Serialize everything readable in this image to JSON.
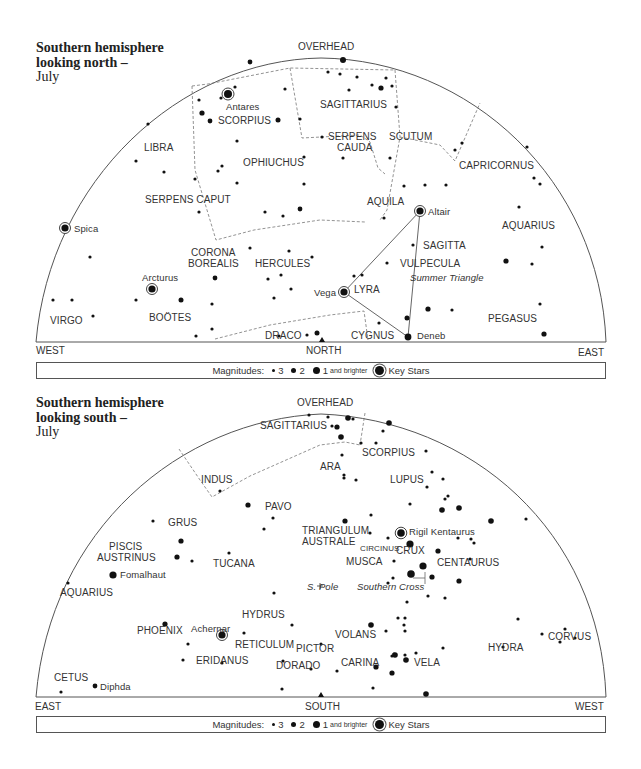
{
  "north": {
    "title": {
      "line1": "Southern hemisphere",
      "line2": "looking north –",
      "month": "July"
    },
    "directions": {
      "top": "OVERHEAD",
      "left": "WEST",
      "center": "NORTH",
      "right": "EAST"
    },
    "constellations": [
      {
        "name": "SAGITTARIUS",
        "x": 317,
        "y": 98
      },
      {
        "name": "SERPENS",
        "x": 330,
        "y": 131
      },
      {
        "name": "CAUDA",
        "x": 338,
        "y": 143
      },
      {
        "name": "SCUTUM",
        "x": 390,
        "y": 131
      },
      {
        "name": "SCORPIUS",
        "x": 217,
        "y": 115
      },
      {
        "name": "LIBRA",
        "x": 143,
        "y": 142
      },
      {
        "name": "OPHIUCHUS",
        "x": 243,
        "y": 158
      },
      {
        "name": "CAPRICORNUS",
        "x": 459,
        "y": 161
      },
      {
        "name": "SERPENS CAPUT",
        "x": 145,
        "y": 194
      },
      {
        "name": "AQUILA",
        "x": 367,
        "y": 196
      },
      {
        "name": "AQUARIUS",
        "x": 502,
        "y": 222
      },
      {
        "name": "CORONA",
        "x": 190,
        "y": 247
      },
      {
        "name": "BOREALIS",
        "x": 188,
        "y": 259
      },
      {
        "name": "HERCULES",
        "x": 255,
        "y": 259
      },
      {
        "name": "SAGITTA",
        "x": 423,
        "y": 242
      },
      {
        "name": "VULPECULA",
        "x": 400,
        "y": 260
      },
      {
        "name": "LYRA",
        "x": 352,
        "y": 284
      },
      {
        "name": "VIRGO",
        "x": 50,
        "y": 320
      },
      {
        "name": "BOÖTES",
        "x": 149,
        "y": 313
      },
      {
        "name": "PEGASUS",
        "x": 488,
        "y": 314
      },
      {
        "name": "DRACO",
        "x": 265,
        "y": 330
      },
      {
        "name": "CYGNUS",
        "x": 351,
        "y": 330
      }
    ],
    "key_stars": [
      {
        "name": "Antares",
        "x": 228,
        "y": 94,
        "sx": 228,
        "sy": 94
      },
      {
        "name": "Spica",
        "x": 75,
        "y": 223
      },
      {
        "name": "Arcturus",
        "x": 143,
        "y": 273
      },
      {
        "name": "Altair",
        "x": 428,
        "y": 207
      },
      {
        "name": "Vega",
        "x": 313,
        "y": 288
      },
      {
        "name": "Deneb",
        "x": 417,
        "y": 331
      }
    ],
    "annotations": [
      {
        "text": "Summer Triangle",
        "x": 410,
        "y": 273
      }
    ],
    "legend": {
      "label": "Magnitudes:",
      "m3": "3",
      "m2": "2",
      "m1": "1",
      "m1_suffix": "and brighter",
      "key": "Key Stars"
    }
  },
  "south": {
    "title": {
      "line1": "Southern hemisphere",
      "line2": "looking south –",
      "month": "July"
    },
    "directions": {
      "top": "OVERHEAD",
      "left": "EAST",
      "center": "SOUTH",
      "right": "WEST"
    },
    "constellations": [
      {
        "name": "SAGITTARIUS",
        "x": 260,
        "y": 420
      },
      {
        "name": "SCORPIUS",
        "x": 362,
        "y": 447
      },
      {
        "name": "ARA",
        "x": 320,
        "y": 461
      },
      {
        "name": "LUPUS",
        "x": 390,
        "y": 475
      },
      {
        "name": "INDUS",
        "x": 201,
        "y": 475
      },
      {
        "name": "PAVO",
        "x": 265,
        "y": 501
      },
      {
        "name": "GRUS",
        "x": 168,
        "y": 517
      },
      {
        "name": "TRIANGULUM",
        "x": 302,
        "y": 525
      },
      {
        "name": "AUSTRALE",
        "x": 302,
        "y": 537
      },
      {
        "name": "PISCIS",
        "x": 109,
        "y": 541
      },
      {
        "name": "AUSTRINUS",
        "x": 97,
        "y": 552
      },
      {
        "name": "TUCANA",
        "x": 213,
        "y": 558
      },
      {
        "name": "CENTAURUS",
        "x": 437,
        "y": 557
      },
      {
        "name": "CRUX",
        "x": 396,
        "y": 561
      },
      {
        "name": "MUSCA",
        "x": 346,
        "y": 572
      },
      {
        "name": "AQUARIUS",
        "x": 60,
        "y": 588
      },
      {
        "name": "HYDRUS",
        "x": 242,
        "y": 608
      },
      {
        "name": "PHOENIX",
        "x": 137,
        "y": 625
      },
      {
        "name": "VOLANS",
        "x": 335,
        "y": 629
      },
      {
        "name": "RETICULUM",
        "x": 235,
        "y": 639
      },
      {
        "name": "PICTOR",
        "x": 296,
        "y": 652
      },
      {
        "name": "HYDRA",
        "x": 488,
        "y": 651
      },
      {
        "name": "CORVUS",
        "x": 548,
        "y": 645
      },
      {
        "name": "ERIDANUS",
        "x": 196,
        "y": 671
      },
      {
        "name": "DORADO",
        "x": 276,
        "y": 676
      },
      {
        "name": "CARINA",
        "x": 341,
        "y": 672
      },
      {
        "name": "VELA",
        "x": 414,
        "y": 672
      },
      {
        "name": "CETUS",
        "x": 54,
        "y": 677
      }
    ],
    "small_labels": [
      {
        "name": "CIRCINUS",
        "x": 360,
        "y": 541
      }
    ],
    "key_stars": [
      {
        "name": "Rigil Kentaurus",
        "x": 401,
        "y": 531
      },
      {
        "name": "Achernar",
        "x": 222,
        "y": 634
      }
    ],
    "named_stars": [
      {
        "name": "Fomalhaut",
        "x": 113,
        "y": 575
      },
      {
        "name": "Diphda",
        "x": 95,
        "y": 686
      }
    ],
    "annotations": [
      {
        "text": "S. Pole",
        "x": 307,
        "y": 581
      },
      {
        "text": "Southern Cross",
        "x": 357,
        "y": 581
      }
    ],
    "legend": {
      "label": "Magnitudes:",
      "m3": "3",
      "m2": "2",
      "m1": "1",
      "m1_suffix": "and brighter",
      "key": "Key Stars"
    }
  }
}
